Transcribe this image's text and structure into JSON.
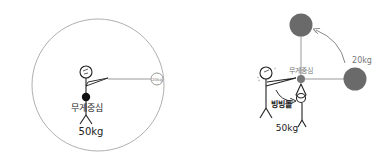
{
  "diagram": {
    "left_panel": {
      "center_label": "무게중심",
      "person_weight": "50kg",
      "small_mass_label": "20kg"
    },
    "right_panel": {
      "center_label": "무게중심",
      "mass_label": "20kg",
      "rotation_label": "빙빙돌",
      "person_weight": "50kg"
    },
    "colors": {
      "ink": "#222222",
      "orbit": "#b0b0b0",
      "mass": "#6a6a6a",
      "arrow": "#888888"
    }
  }
}
